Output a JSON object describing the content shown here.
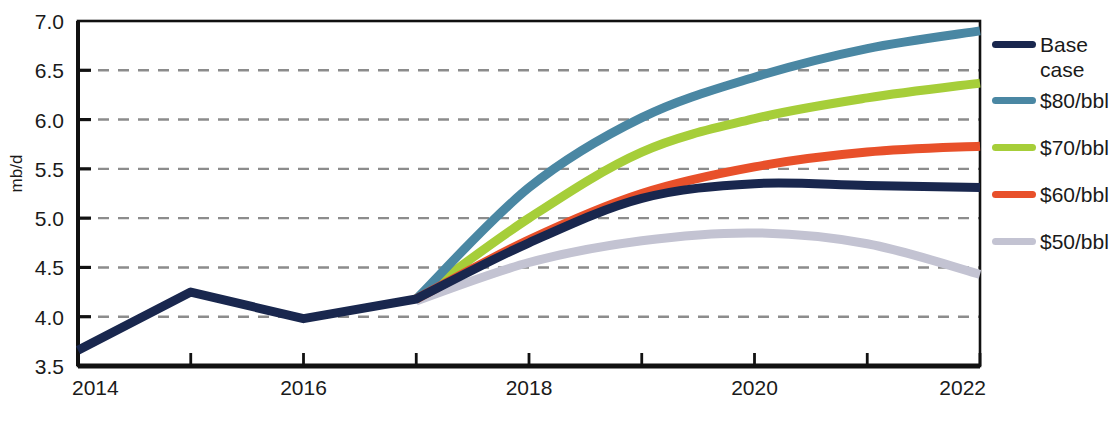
{
  "chart_data": {
    "type": "line",
    "title": "",
    "xlabel": "",
    "ylabel": "mb/d",
    "x": [
      2014,
      2015,
      2016,
      2017,
      2018,
      2019,
      2020,
      2021,
      2022
    ],
    "xlim": [
      2014,
      2022
    ],
    "ylim": [
      3.5,
      7.0
    ],
    "ytick_labels": [
      "7.0",
      "6.5",
      "6.0",
      "5.5",
      "5.0",
      "4.5",
      "4.0",
      "3.5"
    ],
    "yticks": [
      7.0,
      6.5,
      6.0,
      5.5,
      5.0,
      4.5,
      4.0,
      3.5
    ],
    "xtick_labels": [
      "2014",
      "2016",
      "2018",
      "2020",
      "2022"
    ],
    "xticks": [
      2014,
      2016,
      2018,
      2020,
      2022
    ],
    "grid": "horizontal-dashed",
    "legend_position": "right",
    "history_end_year": 2017,
    "series": [
      {
        "name": "Base case",
        "legend_label": "Base\ncase",
        "color": "#19274e",
        "x": [
          2014,
          2015,
          2016,
          2017,
          2018,
          2019,
          2020,
          2021,
          2022
        ],
        "values": [
          3.66,
          4.25,
          3.98,
          4.18,
          4.75,
          5.2,
          5.35,
          5.33,
          5.31
        ]
      },
      {
        "name": "$80/bbl",
        "legend_label": "$80/bbl",
        "color": "#4a87a3",
        "x": [
          2017,
          2018,
          2019,
          2020,
          2021,
          2022
        ],
        "values": [
          4.18,
          5.31,
          6.02,
          6.43,
          6.72,
          6.9
        ]
      },
      {
        "name": "$70/bbl",
        "legend_label": "$70/bbl",
        "color": "#a6ce39",
        "x": [
          2017,
          2018,
          2019,
          2020,
          2021,
          2022
        ],
        "values": [
          4.18,
          5.0,
          5.67,
          6.01,
          6.22,
          6.37
        ]
      },
      {
        "name": "$60/bbl",
        "legend_label": "$60/bbl",
        "color": "#e8502a",
        "x": [
          2017,
          2018,
          2019,
          2020,
          2021,
          2022
        ],
        "values": [
          4.18,
          4.78,
          5.25,
          5.52,
          5.67,
          5.73
        ]
      },
      {
        "name": "$50/bbl",
        "legend_label": "$50/bbl",
        "color": "#c3c3d2",
        "x": [
          2017,
          2018,
          2019,
          2020,
          2021,
          2022
        ],
        "values": [
          4.16,
          4.55,
          4.77,
          4.85,
          4.74,
          4.43
        ]
      }
    ]
  },
  "legend": {
    "items": [
      {
        "label": "Base\ncase",
        "color": "#19274e"
      },
      {
        "label": "$80/bbl",
        "color": "#4a87a3"
      },
      {
        "label": "$70/bbl",
        "color": "#a6ce39"
      },
      {
        "label": "$60/bbl",
        "color": "#e8502a"
      },
      {
        "label": "$50/bbl",
        "color": "#c3c3d2"
      }
    ]
  }
}
